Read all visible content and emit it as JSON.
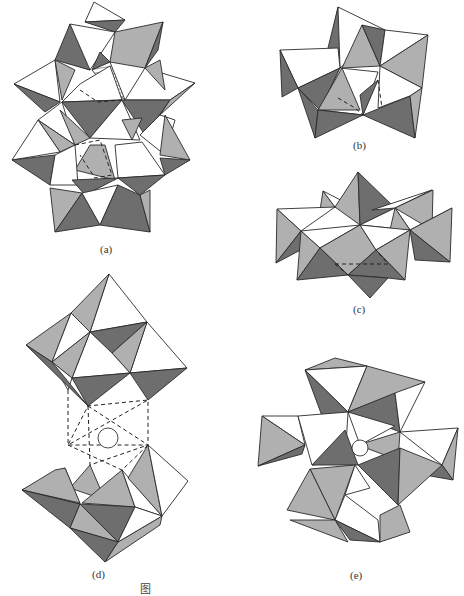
{
  "figure": {
    "panels": [
      {
        "id": "a",
        "label": "(a)"
      },
      {
        "id": "b",
        "label": "(b)"
      },
      {
        "id": "c",
        "label": "(c)"
      },
      {
        "id": "d",
        "label": "(d)"
      },
      {
        "id": "e",
        "label": "(e)"
      }
    ],
    "caption": "图",
    "colors": {
      "dark_face": "#6e6e6e",
      "light_face": "#b0b0b0",
      "white_face": "#ffffff",
      "edge": "#2a2a2a"
    }
  }
}
